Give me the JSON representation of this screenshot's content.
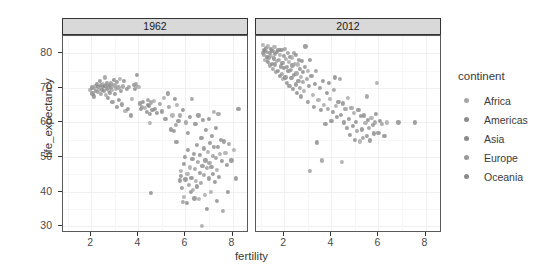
{
  "chart_data": {
    "type": "scatter",
    "title": "",
    "xlabel": "fertility",
    "ylabel": "life_expectancy",
    "xlim": [
      0.8,
      8.7
    ],
    "ylim": [
      28.0,
      85.0
    ],
    "xticks": [
      2,
      4,
      6,
      8
    ],
    "yticks": [
      30,
      40,
      50,
      60,
      70,
      80
    ],
    "grid": true,
    "legend_position": "right",
    "legend_title": "continent",
    "facet_variable": "year",
    "facets": [
      {
        "label": "1962"
      },
      {
        "label": "2012"
      }
    ],
    "legend": [
      {
        "name": "Africa",
        "color": "#a6a6a6"
      },
      {
        "name": "Americas",
        "color": "#8c8c8c"
      },
      {
        "name": "Asia",
        "color": "#8a8a8a"
      },
      {
        "name": "Europe",
        "color": "#999999"
      },
      {
        "name": "Oceania",
        "color": "#8a8a8a"
      }
    ],
    "point_color_default": "#909090",
    "point_size": 4.2,
    "series": [
      {
        "name": "1962",
        "facet": "1962",
        "points": [
          [
            1.95,
            69.3
          ],
          [
            2.02,
            70.1
          ],
          [
            2.05,
            68.4
          ],
          [
            2.1,
            69.9
          ],
          [
            2.12,
            67.5
          ],
          [
            2.18,
            70.5
          ],
          [
            2.2,
            69.0
          ],
          [
            2.25,
            71.2
          ],
          [
            2.28,
            68.8
          ],
          [
            2.3,
            70.3
          ],
          [
            2.33,
            69.6
          ],
          [
            2.38,
            72.1
          ],
          [
            2.4,
            70.8
          ],
          [
            2.42,
            68.2
          ],
          [
            2.45,
            69.4
          ],
          [
            2.48,
            71.0
          ],
          [
            2.5,
            70.2
          ],
          [
            2.55,
            69.1
          ],
          [
            2.58,
            73.0
          ],
          [
            2.6,
            70.6
          ],
          [
            2.62,
            68.0
          ],
          [
            2.65,
            71.5
          ],
          [
            2.68,
            69.8
          ],
          [
            2.7,
            70.4
          ],
          [
            2.72,
            67.0
          ],
          [
            2.75,
            69.2
          ],
          [
            2.78,
            70.9
          ],
          [
            2.8,
            68.6
          ],
          [
            2.82,
            71.3
          ],
          [
            2.85,
            70.0
          ],
          [
            2.88,
            69.5
          ],
          [
            2.9,
            66.0
          ],
          [
            2.95,
            72.3
          ],
          [
            2.98,
            70.7
          ],
          [
            3.0,
            68.3
          ],
          [
            3.05,
            69.7
          ],
          [
            3.08,
            71.8
          ],
          [
            3.1,
            64.5
          ],
          [
            3.15,
            70.1
          ],
          [
            3.18,
            66.4
          ],
          [
            3.22,
            72.5
          ],
          [
            3.25,
            69.0
          ],
          [
            3.3,
            65.2
          ],
          [
            3.35,
            70.4
          ],
          [
            3.4,
            71.9
          ],
          [
            3.45,
            63.3
          ],
          [
            3.5,
            69.6
          ],
          [
            3.55,
            64.0
          ],
          [
            3.6,
            70.2
          ],
          [
            3.68,
            62.0
          ],
          [
            3.72,
            66.8
          ],
          [
            3.8,
            70.9
          ],
          [
            3.85,
            69.8
          ],
          [
            3.9,
            71.0
          ],
          [
            3.95,
            73.8
          ],
          [
            4.0,
            70.3
          ],
          [
            4.05,
            65.5
          ],
          [
            4.1,
            63.8
          ],
          [
            4.15,
            64.6
          ],
          [
            4.2,
            66.0
          ],
          [
            4.28,
            64.2
          ],
          [
            4.35,
            63.0
          ],
          [
            4.4,
            65.0
          ],
          [
            4.42,
            66.5
          ],
          [
            4.45,
            64.8
          ],
          [
            4.48,
            59.8
          ],
          [
            4.5,
            62.5
          ],
          [
            4.52,
            39.5
          ],
          [
            4.55,
            65.8
          ],
          [
            4.6,
            63.5
          ],
          [
            4.65,
            66.2
          ],
          [
            4.7,
            64.0
          ],
          [
            4.8,
            62.8
          ],
          [
            4.9,
            65.4
          ],
          [
            5.0,
            63.2
          ],
          [
            5.1,
            67.0
          ],
          [
            5.15,
            61.0
          ],
          [
            5.25,
            68.4
          ],
          [
            5.3,
            64.4
          ],
          [
            5.4,
            58.0
          ],
          [
            5.45,
            62.0
          ],
          [
            5.5,
            57.5
          ],
          [
            5.55,
            66.8
          ],
          [
            5.6,
            59.3
          ],
          [
            5.62,
            54.3
          ],
          [
            5.65,
            65.0
          ],
          [
            5.7,
            60.5
          ],
          [
            5.75,
            43.2
          ],
          [
            5.78,
            62.0
          ],
          [
            5.8,
            44.5
          ],
          [
            5.82,
            46.0
          ],
          [
            5.85,
            41.0
          ],
          [
            5.88,
            63.5
          ],
          [
            5.9,
            37.0
          ],
          [
            5.92,
            48.0
          ],
          [
            5.95,
            38.5
          ],
          [
            5.98,
            50.0
          ],
          [
            6.0,
            43.5
          ],
          [
            6.02,
            60.0
          ],
          [
            6.05,
            36.8
          ],
          [
            6.08,
            45.0
          ],
          [
            6.1,
            57.0
          ],
          [
            6.12,
            52.0
          ],
          [
            6.15,
            42.0
          ],
          [
            6.18,
            61.5
          ],
          [
            6.2,
            47.0
          ],
          [
            6.22,
            39.8
          ],
          [
            6.25,
            44.0
          ],
          [
            6.28,
            66.8
          ],
          [
            6.3,
            49.5
          ],
          [
            6.32,
            40.5
          ],
          [
            6.35,
            51.0
          ],
          [
            6.38,
            38.0
          ],
          [
            6.4,
            46.5
          ],
          [
            6.42,
            59.5
          ],
          [
            6.45,
            43.0
          ],
          [
            6.48,
            53.5
          ],
          [
            6.5,
            41.5
          ],
          [
            6.52,
            48.5
          ],
          [
            6.55,
            62.0
          ],
          [
            6.58,
            37.8
          ],
          [
            6.6,
            45.5
          ],
          [
            6.62,
            50.5
          ],
          [
            6.65,
            42.5
          ],
          [
            6.68,
            55.5
          ],
          [
            6.7,
            30.0
          ],
          [
            6.72,
            47.5
          ],
          [
            6.75,
            60.8
          ],
          [
            6.78,
            44.8
          ],
          [
            6.8,
            52.5
          ],
          [
            6.82,
            39.0
          ],
          [
            6.85,
            49.0
          ],
          [
            6.88,
            57.8
          ],
          [
            6.9,
            46.8
          ],
          [
            6.92,
            35.0
          ],
          [
            6.95,
            51.5
          ],
          [
            6.98,
            43.8
          ],
          [
            7.0,
            61.0
          ],
          [
            7.02,
            48.2
          ],
          [
            7.05,
            54.0
          ],
          [
            7.08,
            40.0
          ],
          [
            7.1,
            47.2
          ],
          [
            7.12,
            56.0
          ],
          [
            7.15,
            50.2
          ],
          [
            7.18,
            45.2
          ],
          [
            7.2,
            63.0
          ],
          [
            7.22,
            52.8
          ],
          [
            7.25,
            42.8
          ],
          [
            7.28,
            49.8
          ],
          [
            7.3,
            58.5
          ],
          [
            7.32,
            46.2
          ],
          [
            7.35,
            37.2
          ],
          [
            7.38,
            53.0
          ],
          [
            7.4,
            62.5
          ],
          [
            7.42,
            44.2
          ],
          [
            7.45,
            50.8
          ],
          [
            7.5,
            55.0
          ],
          [
            7.55,
            48.8
          ],
          [
            7.6,
            34.5
          ],
          [
            7.65,
            54.5
          ],
          [
            7.7,
            51.2
          ],
          [
            7.75,
            47.8
          ],
          [
            7.8,
            40.0
          ],
          [
            7.85,
            53.8
          ],
          [
            7.95,
            49.0
          ],
          [
            8.05,
            52.0
          ],
          [
            8.15,
            43.8
          ],
          [
            8.25,
            64.0
          ]
        ]
      },
      {
        "name": "2012",
        "facet": "2012",
        "points": [
          [
            1.08,
            82.5
          ],
          [
            1.1,
            80.2
          ],
          [
            1.12,
            81.0
          ],
          [
            1.15,
            79.5
          ],
          [
            1.18,
            80.8
          ],
          [
            1.2,
            78.2
          ],
          [
            1.22,
            81.5
          ],
          [
            1.25,
            79.0
          ],
          [
            1.28,
            80.5
          ],
          [
            1.3,
            77.5
          ],
          [
            1.32,
            82.0
          ],
          [
            1.35,
            78.8
          ],
          [
            1.38,
            80.0
          ],
          [
            1.4,
            76.5
          ],
          [
            1.42,
            81.2
          ],
          [
            1.45,
            79.3
          ],
          [
            1.48,
            77.0
          ],
          [
            1.5,
            80.6
          ],
          [
            1.52,
            75.5
          ],
          [
            1.55,
            78.5
          ],
          [
            1.58,
            81.8
          ],
          [
            1.6,
            76.8
          ],
          [
            1.62,
            79.8
          ],
          [
            1.65,
            74.5
          ],
          [
            1.68,
            80.3
          ],
          [
            1.7,
            77.8
          ],
          [
            1.72,
            75.0
          ],
          [
            1.75,
            81.0
          ],
          [
            1.78,
            78.0
          ],
          [
            1.8,
            73.5
          ],
          [
            1.82,
            79.6
          ],
          [
            1.85,
            76.2
          ],
          [
            1.88,
            80.9
          ],
          [
            1.9,
            74.0
          ],
          [
            1.92,
            77.2
          ],
          [
            1.95,
            72.5
          ],
          [
            1.98,
            79.2
          ],
          [
            2.0,
            75.8
          ],
          [
            2.02,
            81.3
          ],
          [
            2.05,
            73.0
          ],
          [
            2.08,
            78.3
          ],
          [
            2.1,
            76.0
          ],
          [
            2.12,
            71.5
          ],
          [
            2.15,
            80.0
          ],
          [
            2.18,
            74.8
          ],
          [
            2.2,
            77.5
          ],
          [
            2.22,
            70.5
          ],
          [
            2.25,
            79.0
          ],
          [
            2.28,
            75.2
          ],
          [
            2.3,
            72.8
          ],
          [
            2.32,
            78.8
          ],
          [
            2.35,
            76.5
          ],
          [
            2.38,
            69.8
          ],
          [
            2.4,
            80.2
          ],
          [
            2.42,
            73.8
          ],
          [
            2.45,
            77.0
          ],
          [
            2.48,
            71.0
          ],
          [
            2.5,
            79.5
          ],
          [
            2.52,
            74.2
          ],
          [
            2.55,
            68.5
          ],
          [
            2.58,
            76.8
          ],
          [
            2.6,
            72.0
          ],
          [
            2.62,
            78.0
          ],
          [
            2.65,
            70.0
          ],
          [
            2.68,
            75.5
          ],
          [
            2.7,
            73.2
          ],
          [
            2.72,
            67.5
          ],
          [
            2.75,
            77.8
          ],
          [
            2.78,
            71.8
          ],
          [
            2.8,
            74.5
          ],
          [
            2.85,
            69.0
          ],
          [
            2.88,
            76.0
          ],
          [
            2.9,
            82.0
          ],
          [
            2.95,
            72.5
          ],
          [
            3.0,
            66.0
          ],
          [
            3.02,
            75.0
          ],
          [
            3.05,
            70.5
          ],
          [
            3.08,
            78.2
          ],
          [
            3.1,
            46.0
          ],
          [
            3.15,
            73.5
          ],
          [
            3.2,
            68.0
          ],
          [
            3.25,
            64.5
          ],
          [
            3.3,
            71.2
          ],
          [
            3.35,
            74.8
          ],
          [
            3.4,
            54.2
          ],
          [
            3.45,
            66.5
          ],
          [
            3.5,
            70.0
          ],
          [
            3.55,
            63.5
          ],
          [
            3.6,
            49.0
          ],
          [
            3.65,
            72.0
          ],
          [
            3.7,
            65.0
          ],
          [
            3.75,
            59.5
          ],
          [
            3.8,
            68.5
          ],
          [
            3.85,
            64.0
          ],
          [
            3.9,
            71.5
          ],
          [
            3.95,
            66.8
          ],
          [
            4.0,
            60.5
          ],
          [
            4.05,
            63.0
          ],
          [
            4.1,
            69.5
          ],
          [
            4.15,
            73.0
          ],
          [
            4.2,
            64.8
          ],
          [
            4.25,
            61.5
          ],
          [
            4.3,
            66.0
          ],
          [
            4.35,
            72.5
          ],
          [
            4.4,
            62.2
          ],
          [
            4.45,
            48.5
          ],
          [
            4.5,
            65.5
          ],
          [
            4.55,
            60.0
          ],
          [
            4.6,
            63.8
          ],
          [
            4.65,
            58.5
          ],
          [
            4.7,
            67.0
          ],
          [
            4.75,
            61.0
          ],
          [
            4.8,
            56.5
          ],
          [
            4.85,
            64.2
          ],
          [
            4.9,
            59.0
          ],
          [
            4.95,
            62.8
          ],
          [
            5.0,
            55.0
          ],
          [
            5.05,
            60.2
          ],
          [
            5.1,
            57.5
          ],
          [
            5.15,
            63.5
          ],
          [
            5.2,
            54.5
          ],
          [
            5.25,
            61.8
          ],
          [
            5.3,
            58.0
          ],
          [
            5.35,
            55.5
          ],
          [
            5.4,
            62.0
          ],
          [
            5.45,
            59.8
          ],
          [
            5.5,
            56.0
          ],
          [
            5.55,
            60.8
          ],
          [
            5.6,
            58.5
          ],
          [
            5.65,
            54.8
          ],
          [
            5.7,
            61.2
          ],
          [
            5.75,
            59.2
          ],
          [
            5.8,
            56.8
          ],
          [
            5.85,
            60.0
          ],
          [
            5.9,
            62.5
          ],
          [
            5.95,
            71.5
          ],
          [
            6.0,
            57.0
          ],
          [
            6.05,
            60.5
          ],
          [
            6.15,
            59.5
          ],
          [
            6.25,
            56.2
          ],
          [
            6.35,
            60.0
          ],
          [
            6.85,
            60.0
          ],
          [
            7.55,
            60.0
          ],
          [
            5.5,
            67.5
          ]
        ]
      }
    ]
  }
}
